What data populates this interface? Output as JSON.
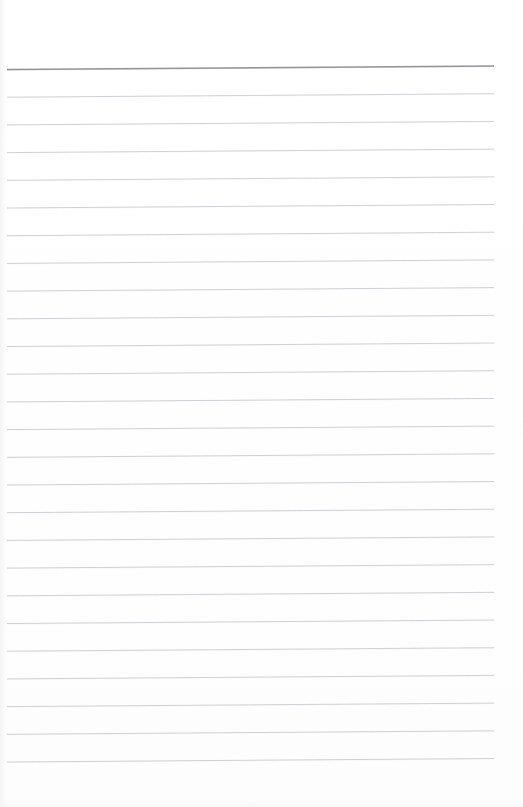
{
  "document": {
    "kind": "lined-paper-scan",
    "title": "Blank Ruled Notebook Page",
    "page_width": 523,
    "page_height": 807,
    "paper_color": "#ffffff",
    "written_content": "",
    "visible_text": ""
  },
  "ruling": {
    "style": "horizontal-ruled",
    "rule_count": 26,
    "rule_spacing_px": 27.7,
    "line_start_x": 7,
    "line_end_x": 494,
    "skew_rise_px": 3.5,
    "header_rule_color": "#8f9194",
    "header_rule_thickness": 1.6,
    "body_rule_color": "#c2c4c7",
    "body_rule_thickness": 0.85,
    "top_margin_px": 60,
    "bottom_margin_px": 42,
    "left_margin_px": 7,
    "right_margin_px": 29,
    "has_vertical_margin_rule": false,
    "lines": [
      {
        "index": 0,
        "y_left": 69.5,
        "y_right": 66.0,
        "role": "header-rule"
      },
      {
        "index": 1,
        "y_left": 97.2,
        "y_right": 93.7,
        "role": "body-rule"
      },
      {
        "index": 2,
        "y_left": 124.9,
        "y_right": 121.4,
        "role": "body-rule"
      },
      {
        "index": 3,
        "y_left": 152.6,
        "y_right": 149.1,
        "role": "body-rule"
      },
      {
        "index": 4,
        "y_left": 180.3,
        "y_right": 176.8,
        "role": "body-rule"
      },
      {
        "index": 5,
        "y_left": 208.0,
        "y_right": 204.5,
        "role": "body-rule"
      },
      {
        "index": 6,
        "y_left": 235.7,
        "y_right": 232.2,
        "role": "body-rule"
      },
      {
        "index": 7,
        "y_left": 263.4,
        "y_right": 259.9,
        "role": "body-rule"
      },
      {
        "index": 8,
        "y_left": 291.1,
        "y_right": 287.6,
        "role": "body-rule"
      },
      {
        "index": 9,
        "y_left": 318.8,
        "y_right": 315.3,
        "role": "body-rule"
      },
      {
        "index": 10,
        "y_left": 346.5,
        "y_right": 343.0,
        "role": "body-rule"
      },
      {
        "index": 11,
        "y_left": 374.2,
        "y_right": 370.7,
        "role": "body-rule"
      },
      {
        "index": 12,
        "y_left": 401.9,
        "y_right": 398.4,
        "role": "body-rule"
      },
      {
        "index": 13,
        "y_left": 429.6,
        "y_right": 426.1,
        "role": "body-rule"
      },
      {
        "index": 14,
        "y_left": 457.3,
        "y_right": 453.8,
        "role": "body-rule"
      },
      {
        "index": 15,
        "y_left": 485.0,
        "y_right": 481.5,
        "role": "body-rule"
      },
      {
        "index": 16,
        "y_left": 512.7,
        "y_right": 509.2,
        "role": "body-rule"
      },
      {
        "index": 17,
        "y_left": 540.4,
        "y_right": 536.9,
        "role": "body-rule"
      },
      {
        "index": 18,
        "y_left": 568.1,
        "y_right": 564.6,
        "role": "body-rule"
      },
      {
        "index": 19,
        "y_left": 595.8,
        "y_right": 592.3,
        "role": "body-rule"
      },
      {
        "index": 20,
        "y_left": 623.5,
        "y_right": 620.0,
        "role": "body-rule"
      },
      {
        "index": 21,
        "y_left": 651.2,
        "y_right": 647.7,
        "role": "body-rule"
      },
      {
        "index": 22,
        "y_left": 678.9,
        "y_right": 675.4,
        "role": "body-rule"
      },
      {
        "index": 23,
        "y_left": 706.6,
        "y_right": 703.1,
        "role": "body-rule"
      },
      {
        "index": 24,
        "y_left": 734.3,
        "y_right": 730.8,
        "role": "body-rule"
      },
      {
        "index": 25,
        "y_left": 762.0,
        "y_right": 758.5,
        "role": "body-rule"
      }
    ]
  }
}
